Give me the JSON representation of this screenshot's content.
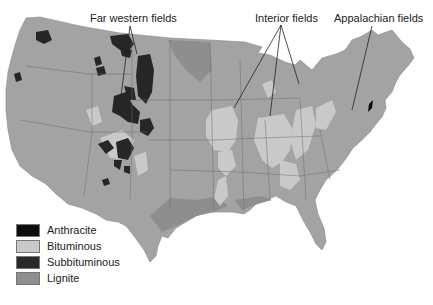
{
  "map": {
    "title": "",
    "region": "Contiguous United States",
    "annotations": [
      {
        "id": "far_western",
        "text": "Far western fields"
      },
      {
        "id": "interior",
        "text": "Interior fields"
      },
      {
        "id": "appalachian",
        "text": "Appalachian fields"
      }
    ],
    "legend": [
      {
        "label": "Anthracite",
        "color": "#0d0d0d"
      },
      {
        "label": "Bituminous",
        "color": "#c9c9c9"
      },
      {
        "label": "Subbituminous",
        "color": "#2a2a2a"
      },
      {
        "label": "Lignite",
        "color": "#8e8e8e"
      }
    ],
    "colors": {
      "land": "#a3a3a3",
      "water": "#ffffff",
      "borders": "#6a6a6a"
    }
  }
}
